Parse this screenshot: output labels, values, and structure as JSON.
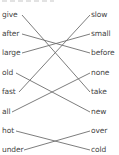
{
  "exercise": {
    "left_words": [
      "give",
      "after",
      "large",
      "old",
      "fast",
      "all",
      "hot",
      "under"
    ],
    "right_words": [
      "slow",
      "small",
      "before",
      "none",
      "take",
      "new",
      "over",
      "cold"
    ],
    "pairs": [
      {
        "left": "give",
        "right": "take"
      },
      {
        "left": "after",
        "right": "before"
      },
      {
        "left": "large",
        "right": "small"
      },
      {
        "left": "old",
        "right": "new"
      },
      {
        "left": "fast",
        "right": "slow"
      },
      {
        "left": "all",
        "right": "none"
      },
      {
        "left": "hot",
        "right": "cold"
      },
      {
        "left": "under",
        "right": "over"
      }
    ],
    "line_color": "#6e6e6e",
    "text_color": "#444444"
  }
}
